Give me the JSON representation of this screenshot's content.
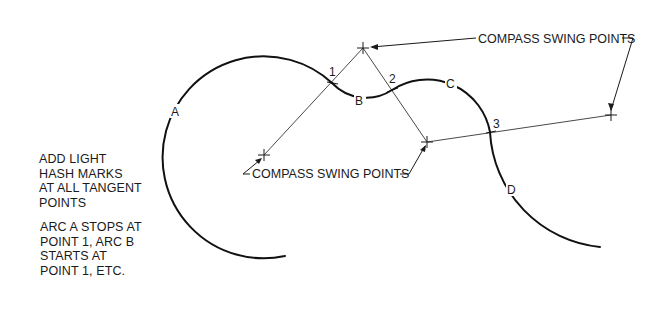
{
  "diagram": {
    "callouts": {
      "top": "COMPASS SWING POINTS",
      "bottom": "COMPASS SWING POINTS"
    },
    "arc_labels": [
      "A",
      "B",
      "C",
      "D"
    ],
    "tangent_points": [
      "1",
      "2",
      "3"
    ],
    "notes": {
      "block1": [
        "ADD LIGHT",
        "HASH MARKS",
        "AT ALL TANGENT",
        "POINTS"
      ],
      "block2": [
        "ARC A STOPS AT",
        "POINT 1, ARC B",
        "STARTS AT",
        "POINT 1, ETC."
      ]
    },
    "colors": {
      "ink": "#1a1a1a",
      "background": "#ffffff"
    }
  }
}
